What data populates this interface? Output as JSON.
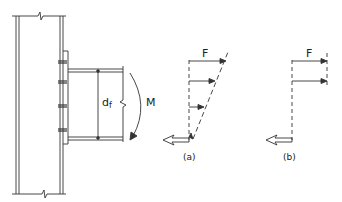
{
  "diagram": {
    "labels": {
      "flange_depth": "d",
      "flange_depth_sub": "f",
      "moment": "M",
      "force_a": "F",
      "force_b": "F",
      "caption_a": "(a)",
      "caption_b": "(b)"
    },
    "colors": {
      "stroke": "#333333",
      "background": "#ffffff"
    }
  }
}
